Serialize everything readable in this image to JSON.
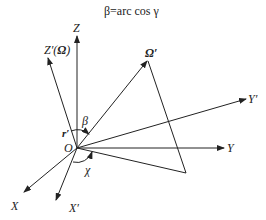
{
  "diagram": {
    "title": "β=arc cos γ",
    "labels": {
      "z": "Z",
      "z_prime": "Z′(",
      "omega_in_z": "Ω",
      "z_prime_close": ")",
      "omega_prime": "Ω′",
      "y_prime": "Y′",
      "y": "Y",
      "x": "X",
      "x_prime": "X′",
      "origin": "O",
      "r_prime": "r′",
      "beta": "β",
      "chi": "χ"
    },
    "colors": {
      "line": "#222222",
      "background": "#ffffff"
    }
  }
}
